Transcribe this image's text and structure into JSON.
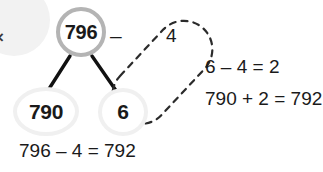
{
  "diagram": {
    "title_text": "796 - 4 number bond subtraction strategy",
    "colors": {
      "ink": "#1a1a1a",
      "root_ring": "#b4b4b4",
      "leaf_ring": "#f0f0f0",
      "dashed_stroke": "#2b2b2b",
      "connector": "#111111",
      "blob": "#f2f2f2",
      "background": "#ffffff"
    },
    "nodes": {
      "root": "796",
      "tens": "790",
      "ones": "6"
    },
    "operator": "–",
    "subtrahend": "4",
    "work_lines": [
      "6 – 4 = 2",
      "790 + 2 = 792"
    ],
    "result_line": "796 – 4 = 792",
    "edge_fragment": "×",
    "selection_lasso": {
      "shape": "dashed-capsule",
      "encircles": [
        "4",
        "6"
      ]
    }
  }
}
